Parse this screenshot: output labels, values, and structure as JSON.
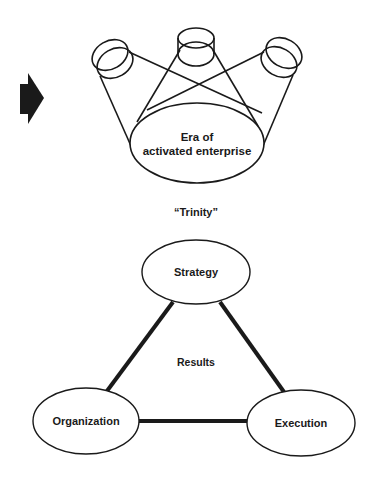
{
  "diagram": {
    "top": {
      "center_label_line1": "Era of",
      "center_label_line2": "activated enterprise",
      "sources": [
        "left-cylinder",
        "center-cylinder",
        "right-cylinder"
      ]
    },
    "caption": "“Trinity”",
    "triangle": {
      "nodes": {
        "top": "Strategy",
        "left": "Organization",
        "right": "Execution"
      },
      "center_label": "Results",
      "edges": [
        [
          "Strategy",
          "Organization"
        ],
        [
          "Strategy",
          "Execution"
        ],
        [
          "Organization",
          "Execution"
        ]
      ]
    },
    "arrow": "right-arrow",
    "colors": {
      "ink": "#1a1a1a",
      "background": "#ffffff"
    }
  }
}
